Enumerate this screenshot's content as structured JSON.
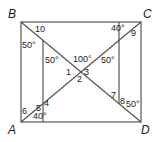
{
  "figure": {
    "vertices": {
      "A": "A",
      "B": "B",
      "C": "C",
      "D": "D"
    },
    "angles": {
      "a1": "1",
      "a2": "2",
      "a3": "3",
      "a4": "4",
      "a5": "5",
      "a6": "6",
      "a7": "7",
      "a8": "8",
      "a9": "9",
      "a10": "10",
      "deg_b": "50°",
      "deg_inner_left": "50°",
      "deg_center": "100°",
      "deg_inner_right": "50°",
      "deg_c": "40°",
      "deg_a": "40°",
      "deg_d": "50°"
    },
    "colors": {
      "line": "#555555",
      "text": "#222222"
    }
  }
}
